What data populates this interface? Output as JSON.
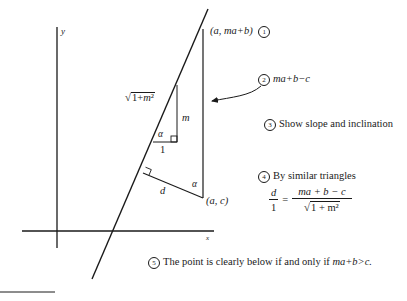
{
  "axes": {
    "y_label": "y",
    "x_label": "x"
  },
  "labels": {
    "top_point": "(a, ma+b)",
    "bottom_point": "(a, c)",
    "hyp_small": "√1+m²",
    "side_m": "m",
    "side_1": "1",
    "alpha_small": "α",
    "alpha_big": "α",
    "side_d": "d"
  },
  "notes": [
    {
      "num": "1",
      "text": ""
    },
    {
      "num": "2",
      "text": "ma+b−c"
    },
    {
      "num": "3",
      "text": "Show slope and inclination"
    },
    {
      "num": "4",
      "text": "By similar triangles"
    },
    {
      "num": "5",
      "text": "The point is clearly below if and only if ",
      "math": "ma+b>c."
    }
  ],
  "equation": {
    "lhs_num": "d",
    "lhs_den": "1",
    "eq": "=",
    "rhs_num": "ma + b − c",
    "rhs_den": "1 + m²"
  },
  "colors": {
    "ink": "#1a1a1a",
    "background": "#ffffff"
  }
}
